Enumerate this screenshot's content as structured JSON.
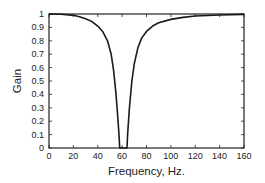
{
  "chart_data": {
    "type": "line",
    "title": "",
    "xlabel": "Frequency, Hz.",
    "ylabel": "Gain",
    "xlim": [
      0,
      160
    ],
    "ylim": [
      0,
      1
    ],
    "grid": false,
    "legend": null,
    "x_ticks": [
      0,
      20,
      40,
      60,
      80,
      100,
      120,
      140,
      160
    ],
    "y_ticks": [
      0,
      0.1,
      0.2,
      0.3,
      0.4,
      0.5,
      0.6,
      0.7,
      0.8,
      0.9,
      1
    ],
    "x_tick_labels": [
      "0",
      "20",
      "40",
      "60",
      "80",
      "100",
      "120",
      "140",
      "160"
    ],
    "y_tick_labels": [
      "0",
      "0.1",
      "0.2",
      "0.3",
      "0.4",
      "0.5",
      "0.6",
      "0.7",
      "0.8",
      "0.9",
      "1"
    ],
    "series": [
      {
        "name": "Notch filter gain",
        "color": "#1a1a1a",
        "x": [
          0,
          10,
          20,
          25,
          30,
          35,
          40,
          44,
          48,
          51,
          53,
          55,
          56.5,
          57.5,
          58,
          59,
          60,
          61,
          62,
          63,
          64,
          64.5,
          66,
          68,
          70,
          73,
          76,
          80,
          85,
          90,
          100,
          110,
          120,
          140,
          160
        ],
        "values": [
          1.0,
          0.998,
          0.99,
          0.98,
          0.965,
          0.945,
          0.91,
          0.87,
          0.8,
          0.7,
          0.58,
          0.4,
          0.22,
          0.09,
          0.0,
          0.0,
          0.0,
          0.0,
          0.0,
          0.0,
          0.0,
          0.1,
          0.3,
          0.5,
          0.63,
          0.75,
          0.82,
          0.87,
          0.91,
          0.935,
          0.96,
          0.975,
          0.985,
          0.993,
          0.997
        ]
      }
    ]
  },
  "labels": {
    "xlabel": "Frequency, Hz.",
    "ylabel": "Gain"
  }
}
